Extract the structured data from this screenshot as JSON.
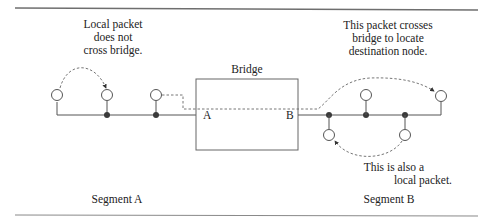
{
  "diagram": {
    "title": "Bridge",
    "bridge": {
      "label": "Bridge",
      "port_a": "A",
      "port_b": "B"
    },
    "segments": [
      {
        "id": "A",
        "label": "Segment A"
      },
      {
        "id": "B",
        "label": "Segment B"
      }
    ],
    "annotations": {
      "local_a": [
        "Local packet",
        "does not",
        "cross bridge."
      ],
      "crossing": [
        "This packet crosses",
        "bridge to locate",
        "destination node."
      ],
      "local_b": [
        "This is also a",
        "local packet."
      ]
    },
    "colors": {
      "line": "#555555",
      "tap": "#3a3a3a",
      "node_fill": "#ffffff",
      "dashed": "#666666",
      "rule": "#6e6e6e"
    }
  }
}
